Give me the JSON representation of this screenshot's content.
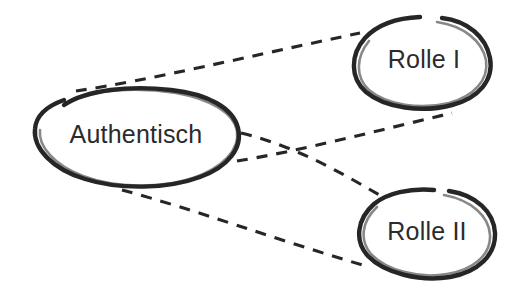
{
  "diagram": {
    "type": "concept-map",
    "background_color": "#ffffff",
    "ink_color": "#262626",
    "text_color": "#2b2b2b",
    "style": "hand-drawn",
    "nodes": [
      {
        "id": "authentisch",
        "label": "Authentisch",
        "shape": "ellipse",
        "cx": 135,
        "cy": 138,
        "rx": 103,
        "ry": 46
      },
      {
        "id": "rolle-1",
        "label": "Rolle I",
        "shape": "ellipse",
        "cx": 422,
        "cy": 62,
        "rx": 69,
        "ry": 45
      },
      {
        "id": "rolle-2",
        "label": "Rolle II",
        "shape": "ellipse",
        "cx": 425,
        "cy": 234,
        "rx": 70,
        "ry": 43
      }
    ],
    "edges": [
      {
        "id": "edge-authentisch-rolle1-top",
        "from": "authentisch",
        "to": "rolle-1",
        "style": "dashed",
        "label": ""
      },
      {
        "id": "edge-authentisch-rolle1-lower",
        "from": "authentisch",
        "to": "rolle-1",
        "style": "dashed",
        "label": ""
      },
      {
        "id": "edge-authentisch-rolle2-upper",
        "from": "authentisch",
        "to": "rolle-2",
        "style": "dashed",
        "label": ""
      },
      {
        "id": "edge-authentisch-rolle2-bottom",
        "from": "authentisch",
        "to": "rolle-2",
        "style": "dashed",
        "label": ""
      }
    ]
  }
}
